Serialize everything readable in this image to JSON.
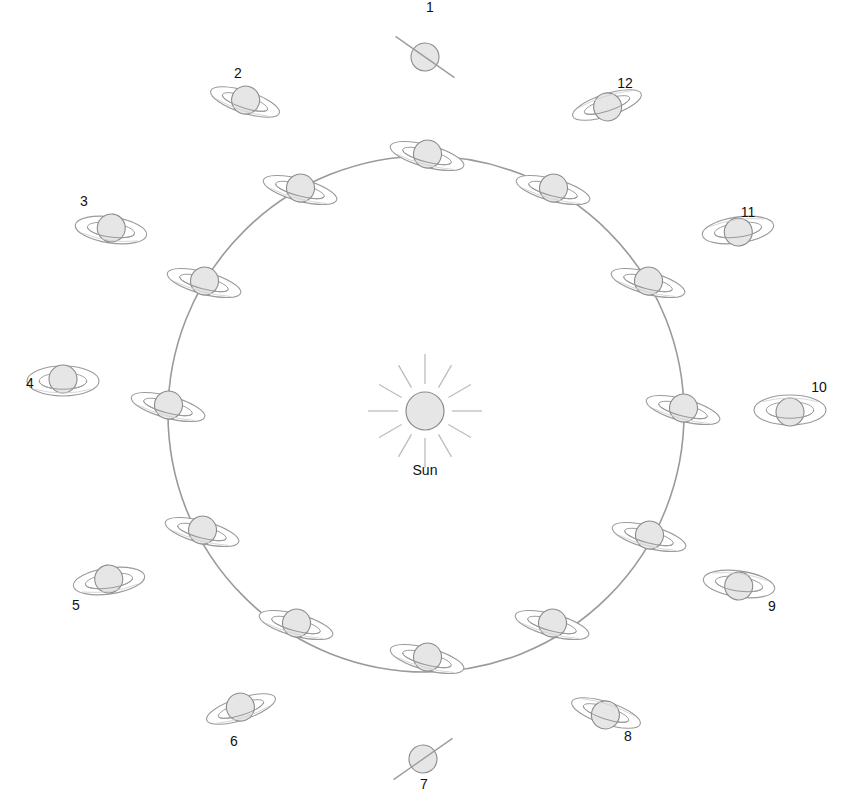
{
  "diagram": {
    "title": "",
    "sun": {
      "label": "Sun",
      "x": 425,
      "y": 411,
      "r": 19
    },
    "orbit": {
      "cx": 426,
      "cy": 414,
      "r": 258,
      "color": "#9a9a9a"
    },
    "colors": {
      "planet_fill": "#e6e6e6",
      "planet_stroke": "#8c8c8c",
      "ring_stroke": "#9a9a9a",
      "ray": "#bdbdbd",
      "label": "#111111"
    },
    "orbit_planets": [
      {
        "x": 427,
        "y": 156
      },
      {
        "x": 553,
        "y": 190
      },
      {
        "x": 648,
        "y": 283
      },
      {
        "x": 683,
        "y": 410
      },
      {
        "x": 649,
        "y": 537
      },
      {
        "x": 552,
        "y": 625
      },
      {
        "x": 427,
        "y": 659
      },
      {
        "x": 296,
        "y": 625
      },
      {
        "x": 202,
        "y": 532
      },
      {
        "x": 168,
        "y": 407
      },
      {
        "x": 204,
        "y": 283
      },
      {
        "x": 300,
        "y": 190
      }
    ],
    "views": [
      {
        "label": "1",
        "x": 425,
        "y": 57,
        "lx": 430,
        "ly": 12,
        "ring_ry": 0,
        "tilt": 35,
        "open": "edge"
      },
      {
        "label": "2",
        "x": 245,
        "y": 102,
        "lx": 238,
        "ly": 78,
        "ring_ry": 11,
        "tilt": 18,
        "open": "north"
      },
      {
        "label": "3",
        "x": 111,
        "y": 230,
        "lx": 84,
        "ly": 206,
        "ring_ry": 13,
        "tilt": 8,
        "open": "north"
      },
      {
        "label": "4",
        "x": 63,
        "y": 381,
        "lx": 30,
        "ly": 388,
        "ring_ry": 15,
        "tilt": 0,
        "open": "north"
      },
      {
        "label": "5",
        "x": 109,
        "y": 581,
        "lx": 76,
        "ly": 610,
        "ring_ry": 13,
        "tilt": -8,
        "open": "north"
      },
      {
        "label": "6",
        "x": 241,
        "y": 709,
        "lx": 234,
        "ly": 746,
        "ring_ry": 11,
        "tilt": -18,
        "open": "north"
      },
      {
        "label": "7",
        "x": 423,
        "y": 759,
        "lx": 424,
        "ly": 789,
        "ring_ry": 0,
        "tilt": -35,
        "open": "edge"
      },
      {
        "label": "8",
        "x": 606,
        "y": 713,
        "lx": 628,
        "ly": 741,
        "ring_ry": 11,
        "tilt": 18,
        "open": "south"
      },
      {
        "label": "9",
        "x": 739,
        "y": 584,
        "lx": 772,
        "ly": 611,
        "ring_ry": 13,
        "tilt": 8,
        "open": "south"
      },
      {
        "label": "10",
        "x": 790,
        "y": 410,
        "lx": 819,
        "ly": 392,
        "ring_ry": 15,
        "tilt": 0,
        "open": "south"
      },
      {
        "label": "11",
        "x": 738,
        "y": 230,
        "lx": 748,
        "ly": 217,
        "ring_ry": 13,
        "tilt": -8,
        "open": "south"
      },
      {
        "label": "12",
        "x": 607,
        "y": 105,
        "lx": 625,
        "ly": 88,
        "ring_ry": 11,
        "tilt": -18,
        "open": "south"
      }
    ]
  }
}
